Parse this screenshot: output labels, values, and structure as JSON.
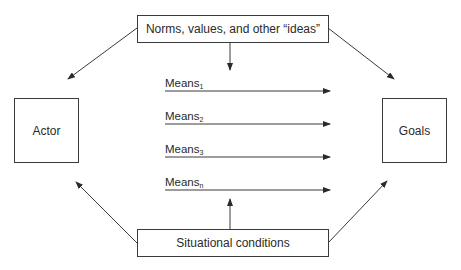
{
  "diagram": {
    "top_box": {
      "label": "Norms, values, and other “ideas”"
    },
    "left_box": {
      "label": "Actor"
    },
    "right_box": {
      "label": "Goals"
    },
    "bottom_box": {
      "label": "Situational conditions"
    },
    "means": [
      {
        "label": "Means",
        "subscript": "1"
      },
      {
        "label": "Means",
        "subscript": "2"
      },
      {
        "label": "Means",
        "subscript": "3"
      },
      {
        "label": "Means",
        "subscript": "n"
      }
    ],
    "colors": {
      "line": "#3a3a3a",
      "text": "#2a2a2a",
      "background": "#ffffff"
    }
  }
}
